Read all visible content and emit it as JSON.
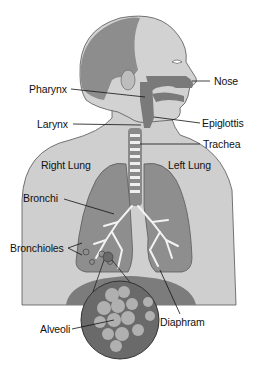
{
  "diagram": {
    "colors": {
      "skin": "#c9c9c9",
      "skin_light": "#dcdcdc",
      "hair": "#8a8a8a",
      "airway": "#7a7a7a",
      "lung": "#8c8c8c",
      "lung_dark": "#6e6e6e",
      "trachea_ring": "#efefef",
      "diaphragm": "#7c7c7c",
      "alveoli_circle": "#6a6a6a",
      "alveoli_bubble": "#b8b8b8",
      "line": "#111111",
      "text": "#111111"
    },
    "labels": {
      "nose": "Nose",
      "pharynx": "Pharynx",
      "epiglottis": "Epiglottis",
      "larynx": "Larynx",
      "trachea": "Trachea",
      "right_lung": "Right Lung",
      "left_lung": "Left Lung",
      "bronchi": "Bronchi",
      "bronchioles": "Bronchioles",
      "alveoli": "Alveoli",
      "diaphragm": "Diaphram"
    }
  }
}
